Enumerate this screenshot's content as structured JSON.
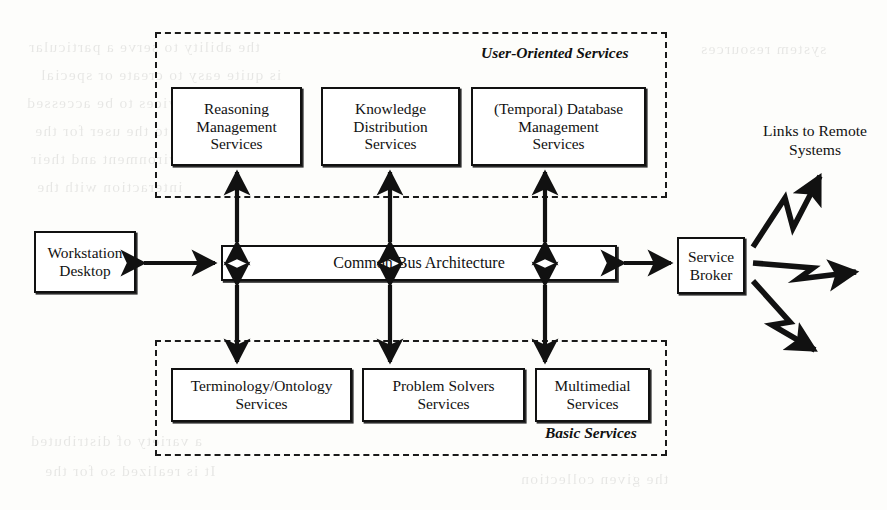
{
  "diagram": {
    "regions": [
      {
        "id": "user-oriented",
        "label": "User-Oriented Services"
      },
      {
        "id": "basic",
        "label": "Basic Services"
      }
    ],
    "user_oriented_services": [
      {
        "id": "reasoning-management",
        "lines": [
          "Reasoning",
          "Management",
          "Services"
        ]
      },
      {
        "id": "knowledge-distribution",
        "lines": [
          "Knowledge",
          "Distribution",
          "Services"
        ]
      },
      {
        "id": "temporal-database-management",
        "lines": [
          "(Temporal) Database",
          "Management",
          "Services"
        ]
      }
    ],
    "basic_services": [
      {
        "id": "terminology-ontology",
        "lines": [
          "Terminology/Ontology",
          "Services"
        ]
      },
      {
        "id": "problem-solvers",
        "lines": [
          "Problem Solvers",
          "Services"
        ]
      },
      {
        "id": "multimedial",
        "lines": [
          "Multimedial",
          "Services"
        ]
      }
    ],
    "core": {
      "workstation": {
        "id": "workstation-desktop",
        "lines": [
          "Workstation",
          "Desktop"
        ]
      },
      "bus": {
        "id": "common-bus-architecture",
        "lines": [
          "Common Bus Architecture"
        ]
      },
      "broker": {
        "id": "service-broker",
        "lines": [
          "Service",
          "Broker"
        ]
      }
    },
    "remote": {
      "id": "links-to-remote-systems",
      "lines": [
        "Links to Remote",
        "Systems"
      ],
      "link_count": 3
    },
    "connectors": [
      {
        "id": "workstation-bus",
        "kind": "double-arrow",
        "orientation": "horizontal"
      },
      {
        "id": "bus-broker",
        "kind": "double-arrow",
        "orientation": "horizontal"
      },
      {
        "id": "bus-reasoning",
        "kind": "double-arrow",
        "orientation": "vertical"
      },
      {
        "id": "bus-knowledge",
        "kind": "double-arrow",
        "orientation": "vertical"
      },
      {
        "id": "bus-temporal-db",
        "kind": "double-arrow",
        "orientation": "vertical"
      },
      {
        "id": "bus-terminology",
        "kind": "double-arrow",
        "orientation": "vertical"
      },
      {
        "id": "bus-problem-solvers",
        "kind": "double-arrow",
        "orientation": "vertical"
      },
      {
        "id": "bus-multimedial",
        "kind": "double-arrow",
        "orientation": "vertical"
      },
      {
        "id": "broker-remote-upper",
        "kind": "zigzag-arrow",
        "orientation": "up-right"
      },
      {
        "id": "broker-remote-middle",
        "kind": "zigzag-arrow",
        "orientation": "right"
      },
      {
        "id": "broker-remote-lower",
        "kind": "zigzag-arrow",
        "orientation": "down-right"
      }
    ],
    "colors": {
      "ink": "#111111",
      "page": "#fdfdfb",
      "box_fill": "#ffffff"
    },
    "scan_artifacts": {
      "note": "faint mirrored bleed-through text from reverse of scanned page",
      "fragments": [
        "the ability to serve a particular",
        "is quite easy to create or special",
        "tools and services to be accessed",
        "provided to the user for the",
        "environment and their",
        "interaction with the",
        "system resources",
        "a variety of distributed",
        "It is realized so for the",
        "the given collection"
      ]
    }
  }
}
